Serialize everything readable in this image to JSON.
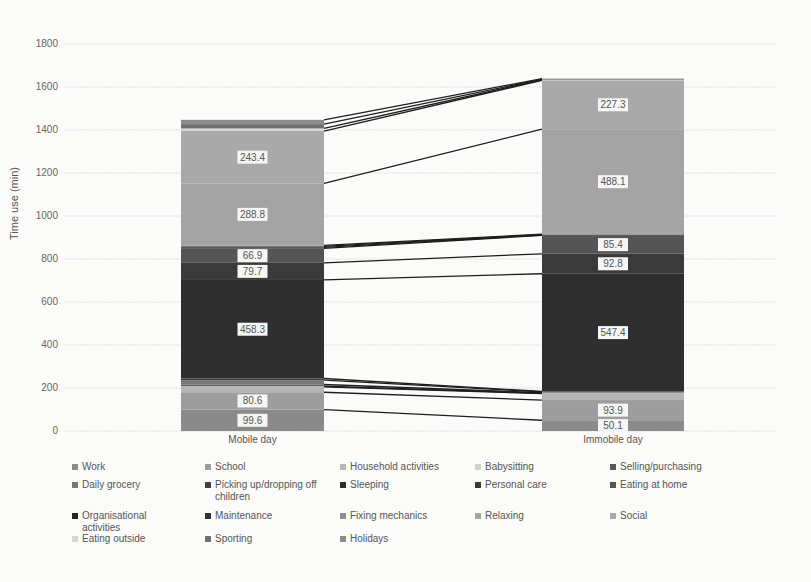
{
  "chart_data": {
    "type": "bar",
    "subtype": "stacked",
    "title": "",
    "xlabel": "",
    "ylabel": "Time use (min)",
    "ylim": [
      0,
      1800
    ],
    "yticks": [
      0,
      200,
      400,
      600,
      800,
      1000,
      1200,
      1400,
      1600,
      1800
    ],
    "grid": true,
    "legend_position": "bottom",
    "categories": [
      "Mobile day",
      "Immobile day"
    ],
    "series": [
      {
        "name": "Work",
        "color": "#8a8a8a",
        "values": [
          99.6,
          50.1
        ],
        "label": [
          true,
          true
        ]
      },
      {
        "name": "School",
        "color": "#9d9d9d",
        "values": [
          80.6,
          93.9
        ],
        "label": [
          true,
          true
        ]
      },
      {
        "name": "Household activities",
        "color": "#b5b5b5",
        "values": [
          25,
          30
        ],
        "label": [
          false,
          false
        ]
      },
      {
        "name": "Babysitting",
        "color": "#cfcfcf",
        "values": [
          3,
          2
        ],
        "label": [
          false,
          false
        ]
      },
      {
        "name": "Selling/purchasing",
        "color": "#5a5a5a",
        "values": [
          8,
          2
        ],
        "label": [
          false,
          false
        ]
      },
      {
        "name": "Daily grocery",
        "color": "#777777",
        "values": [
          20,
          4
        ],
        "label": [
          false,
          false
        ]
      },
      {
        "name": "Picking up/dropping off children",
        "color": "#3f3f3f",
        "values": [
          8,
          2
        ],
        "label": [
          false,
          false
        ]
      },
      {
        "name": "Sleeping",
        "color": "#2e2e2e",
        "values": [
          458.3,
          547.4
        ],
        "label": [
          true,
          true
        ]
      },
      {
        "name": "Personal care",
        "color": "#3a3a3a",
        "values": [
          79.7,
          92.8
        ],
        "label": [
          true,
          true
        ]
      },
      {
        "name": "Eating at home",
        "color": "#555555",
        "values": [
          66.9,
          85.4
        ],
        "label": [
          true,
          true
        ]
      },
      {
        "name": "Organisational activities",
        "color": "#262626",
        "values": [
          5,
          2
        ],
        "label": [
          false,
          false
        ]
      },
      {
        "name": "Maintenance",
        "color": "#333333",
        "values": [
          5,
          2
        ],
        "label": [
          false,
          false
        ]
      },
      {
        "name": "Fixing mechanics",
        "color": "#8f8f8f",
        "values": [
          4,
          2
        ],
        "label": [
          false,
          false
        ]
      },
      {
        "name": "Relaxing",
        "color": "#a4a4a4",
        "values": [
          288.8,
          488.1
        ],
        "label": [
          true,
          true
        ]
      },
      {
        "name": "Social",
        "color": "#a9a9a9",
        "values": [
          243.4,
          227.3
        ],
        "label": [
          true,
          true
        ]
      },
      {
        "name": "Eating outside",
        "color": "#d6d6d6",
        "values": [
          12,
          2
        ],
        "label": [
          false,
          false
        ]
      },
      {
        "name": "Sporting",
        "color": "#6f6f6f",
        "values": [
          20,
          3
        ],
        "label": [
          false,
          false
        ]
      },
      {
        "name": "Holidays",
        "color": "#8c8c8c",
        "values": [
          20,
          3
        ],
        "label": [
          false,
          false
        ]
      }
    ]
  },
  "legend": {
    "items": [
      "Work",
      "School",
      "Household activities",
      "Babysitting",
      "Selling/purchasing",
      "Daily grocery",
      "Picking up/dropping off children",
      "Sleeping",
      "Personal care",
      "Eating at home",
      "Organisational activities",
      "Maintenance",
      "Fixing mechanics",
      "Relaxing",
      "Social",
      "Eating outside",
      "Sporting",
      "Holidays"
    ]
  }
}
